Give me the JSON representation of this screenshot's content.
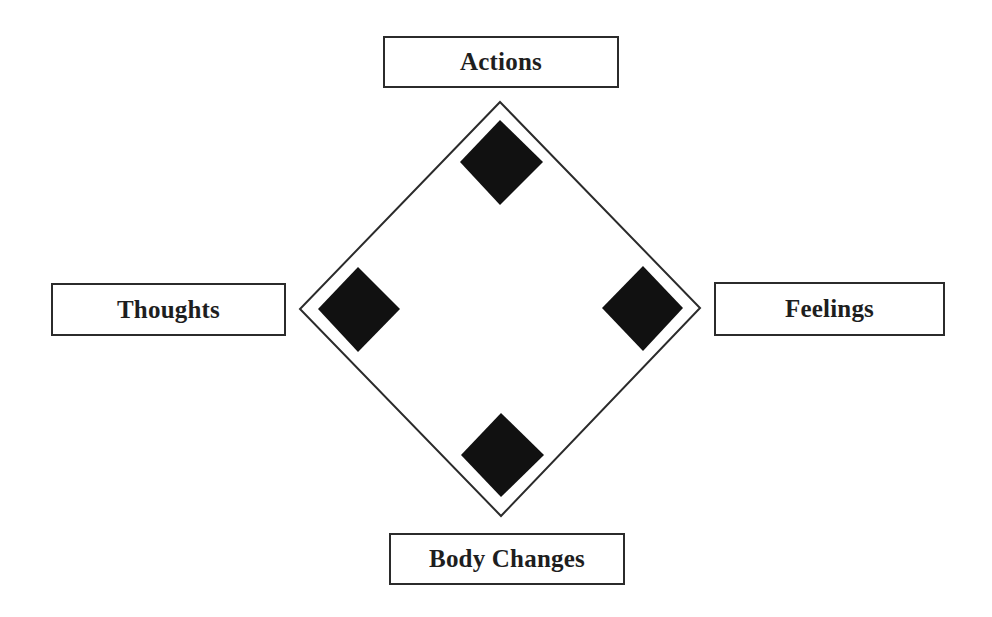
{
  "diagram": {
    "type": "cycle-diamond",
    "nodes": [
      {
        "id": "actions",
        "label": "Actions",
        "position": "top"
      },
      {
        "id": "thoughts",
        "label": "Thoughts",
        "position": "left"
      },
      {
        "id": "feelings",
        "label": "Feelings",
        "position": "right"
      },
      {
        "id": "body_changes",
        "label": "Body Changes",
        "position": "bottom"
      }
    ],
    "colors": {
      "outline": "#2b2b2b",
      "marker_fill": "#111111",
      "background": "#ffffff",
      "text": "#1e1e1e"
    }
  },
  "labels": {
    "top": "Actions",
    "left": "Thoughts",
    "right": "Feelings",
    "bottom": "Body Changes"
  }
}
